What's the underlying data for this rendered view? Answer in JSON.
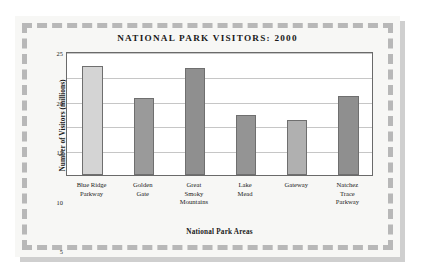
{
  "chart_data": {
    "type": "bar",
    "title": "NATIONAL PARK VISITORS: 2000",
    "xlabel": "National Park Areas",
    "ylabel": "Number of Visitors (millions)",
    "categories": [
      "Blue Ridge Parkway",
      "Golden Gate",
      "Great Smoky Mountains",
      "Lake Mead",
      "Gateway",
      "Natchez Trace Parkway"
    ],
    "category_lines": [
      [
        "Blue Ridge",
        "Parkway"
      ],
      [
        "Golden",
        "Gate"
      ],
      [
        "Great",
        "Smoky",
        "Mountains"
      ],
      [
        "Lake",
        "Mead"
      ],
      [
        "Gateway"
      ],
      [
        "Natchez",
        "Trace",
        "Parkway"
      ]
    ],
    "values": [
      22,
      15.5,
      21.5,
      12,
      11,
      16
    ],
    "bar_colors": [
      "#d4d4d4",
      "#9a9a9a",
      "#8f8f8f",
      "#949494",
      "#b0b0b0",
      "#8f8f8f"
    ],
    "ylim": [
      0,
      25
    ],
    "yticks": [
      5,
      10,
      15,
      20,
      25
    ],
    "ytick_labels": [
      "5",
      "10",
      "15",
      "20",
      "25"
    ],
    "grid": true,
    "legend": null,
    "axis_color": "#6a6a6a",
    "gridline_color": "#c6c6c6",
    "frame_color": "#b8b8b8",
    "page_background": "#ffffff",
    "card_background": "#f7f7f5",
    "plot_background": "#ffffff"
  }
}
